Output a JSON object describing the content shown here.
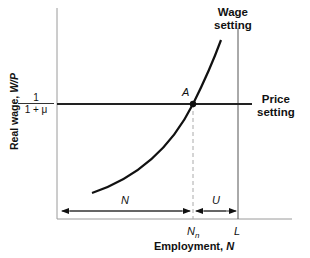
{
  "diagram": {
    "type": "labor-market-equilibrium",
    "y_axis_label": {
      "prefix": "Real wage, ",
      "var": "W/P"
    },
    "x_axis_label": {
      "prefix": "Employment, ",
      "var": "N"
    },
    "price_level_label": {
      "numerator": "1",
      "denominator": "1 + μ"
    },
    "curves": {
      "wage_setting": {
        "line1": "Wage",
        "line2": "setting"
      },
      "price_setting": {
        "line1": "Price",
        "line2": "setting"
      }
    },
    "equilibrium_point": "A",
    "x_ticks": {
      "natural": "N",
      "natural_sub": "n",
      "labor_force": "L"
    },
    "brackets": {
      "employment": "N",
      "unemployment": "U"
    },
    "colors": {
      "line": "#111111",
      "axis": "#9a9a9a",
      "dashed": "#aaaaaa"
    }
  }
}
